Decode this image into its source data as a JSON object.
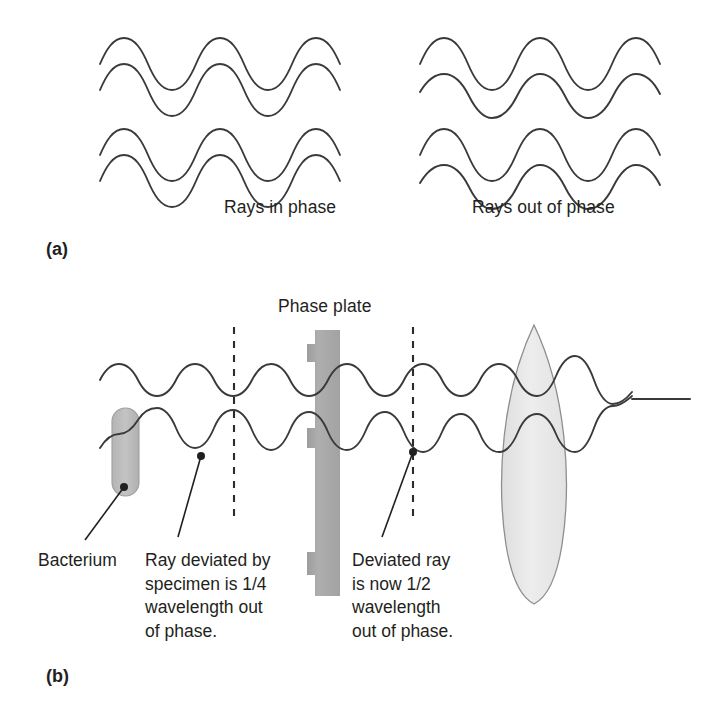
{
  "figure": {
    "title_alt": "Phase-contrast microscopy light path diagram",
    "background_color": "#ffffff",
    "wave_color": "#3a3a3a",
    "text_color": "#231f20"
  },
  "panel_a": {
    "label": "(a)",
    "left_caption": "Rays in phase",
    "right_caption": "Rays out of phase",
    "left_group": {
      "wave_count": 4,
      "relationship": "in-phase",
      "phase_offsets_deg": [
        0,
        0,
        0,
        0
      ]
    },
    "right_group": {
      "wave_count": 4,
      "relationship": "out-of-phase",
      "phase_offsets_deg": [
        0,
        180,
        0,
        180
      ]
    }
  },
  "panel_b": {
    "label": "(b)",
    "phase_plate_label": "Phase plate",
    "bacterium_label": "Bacterium",
    "caption_left": "Ray deviated by specimen is 1/4 wavelength out of phase.",
    "caption_left_lines": [
      "Ray deviated by",
      "specimen is 1/4",
      "wavelength out",
      "of phase."
    ],
    "caption_right": "Deviated ray is now 1/2 wavelength out of phase.",
    "caption_right_lines": [
      "Deviated ray",
      "is now 1/2",
      "wavelength",
      "out of phase."
    ],
    "elements": {
      "bacterium": {
        "shape": "rounded-capsule",
        "fill": "#b9b9b9"
      },
      "phase_plate": {
        "shape": "notched-vertical-bar",
        "fill": "#a8a8a8"
      },
      "lens": {
        "shape": "biconvex-lens",
        "fill": "#e8e8e8"
      },
      "output_ray": {
        "shape": "straight-line",
        "meaning": "destructive-interference"
      }
    },
    "markers": {
      "quarter_wave_gridline": "1/4 wavelength out of phase",
      "half_wave_gridline": "1/2 wavelength out of phase"
    }
  }
}
